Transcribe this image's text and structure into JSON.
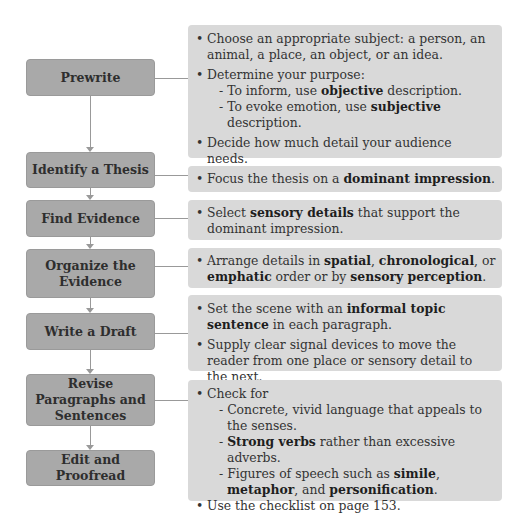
{
  "steps": [
    {
      "label": "Prewrite"
    },
    {
      "label": "Identify a Thesis"
    },
    {
      "label": "Find Evidence"
    },
    {
      "label": "Organize the Evidence"
    },
    {
      "label": "Write a Draft"
    },
    {
      "label": "Revise Paragraphs and Sentences"
    },
    {
      "label": "Edit and Proofread"
    }
  ],
  "details": {
    "prewrite": {
      "b1": "Choose an appropriate subject: a person, an animal, a place, an object, or an idea.",
      "b2": "Determine your purpose:",
      "s1_pre": "- To inform, use ",
      "s1_bold": "objective",
      "s1_post": " description.",
      "s2_pre": "- To evoke emotion, use ",
      "s2_bold": "subjective",
      "s2_post": " description.",
      "b3": "Decide how much detail your audience needs.",
      "b4": "Apply questioning to the five senses."
    },
    "thesis": {
      "pre": "Focus the thesis on a ",
      "bold": "dominant impression",
      "post": "."
    },
    "evidence": {
      "pre": "Select ",
      "bold": "sensory details",
      "post": " that support the dominant impression."
    },
    "organize": {
      "pre": "Arrange details in ",
      "bold1": "spatial",
      "mid1": ", ",
      "bold2": "chronological",
      "mid2": ", or ",
      "bold3": "emphatic",
      "mid3": " order or by ",
      "bold4": "sensory perception",
      "post": "."
    },
    "draft": {
      "b1_pre": "Set the scene with an ",
      "b1_bold": "informal topic sentence",
      "b1_post": " in each paragraph.",
      "b2": "Supply clear signal devices to move the reader from one place or sensory detail to the next."
    },
    "revise": {
      "b1": "Check for",
      "s1": "- Concrete, vivid language that appeals to the senses.",
      "s2_pre": "- ",
      "s2_bold": "Strong verbs",
      "s2_post": " rather than excessive adverbs.",
      "s3_pre": "- Figures of speech such as ",
      "s3_b1": "simile",
      "s3_m1": ", ",
      "s3_b2": "metaphor",
      "s3_m2": ", and ",
      "s3_b3": "personification",
      "s3_post": ".",
      "b2": "Use the checklist on page 153."
    }
  }
}
